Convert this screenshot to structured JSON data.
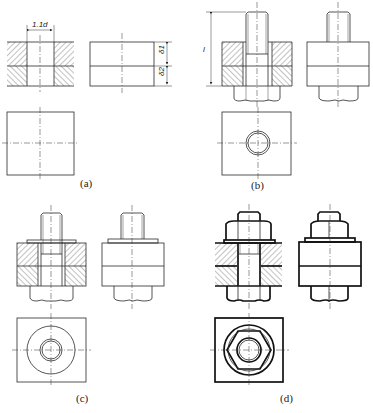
{
  "figure": {
    "panels": [
      {
        "id": "a",
        "label": "(a)",
        "description": "two plates with drilled hole, front section, side view, top view"
      },
      {
        "id": "b",
        "label": "(b)",
        "description": "bolt inserted through plates"
      },
      {
        "id": "c",
        "label": "(c)",
        "description": "washer added"
      },
      {
        "id": "d",
        "label": "(d)",
        "description": "nut tightened, final thick outline"
      }
    ],
    "dimensions": {
      "hole_diameter": "1.1d",
      "plate1_thickness": "δ1",
      "plate2_thickness": "δ2",
      "bolt_length": "l"
    }
  }
}
